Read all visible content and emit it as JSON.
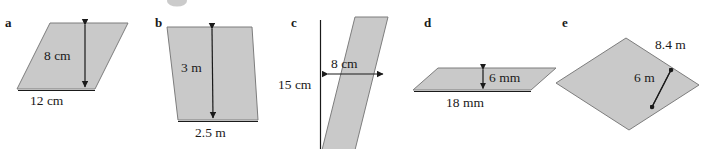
{
  "page": {
    "background_color": "#ffffff",
    "shape_fill_color": "#c9c9c9",
    "shape_stroke_color": "#7d7d7d",
    "text_color": "#1a1a1a"
  },
  "figures": [
    {
      "id": "a",
      "letter": "a",
      "shape": "parallelogram",
      "height_label": "8 cm",
      "base_label": "12 cm",
      "labels": [
        "8 cm",
        "12 cm"
      ]
    },
    {
      "id": "b",
      "letter": "b",
      "shape": "parallelogram",
      "height_label": "3 m",
      "base_label": "2.5 m",
      "labels": [
        "3 m",
        "2.5 m"
      ]
    },
    {
      "id": "c",
      "letter": "c",
      "shape": "parallelogram",
      "height_label": "8 cm",
      "base_label": "15 cm",
      "labels": [
        "8 cm",
        "15 cm"
      ]
    },
    {
      "id": "d",
      "letter": "d",
      "shape": "parallelogram",
      "height_label": "6 mm",
      "base_label": "18 mm",
      "labels": [
        "6 mm",
        "18 mm"
      ]
    },
    {
      "id": "e",
      "letter": "e",
      "shape": "parallelogram",
      "height_label": "8.4 m",
      "base_label": "6 m",
      "labels": [
        "8.4 m",
        "6 m"
      ]
    }
  ]
}
